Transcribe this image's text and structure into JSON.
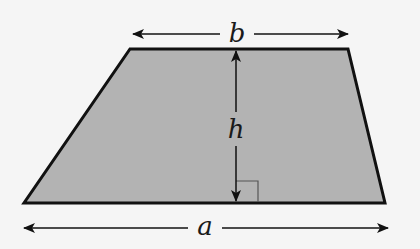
{
  "diagram": {
    "shape": "trapezoid",
    "colors": {
      "background": "#f5f5f5",
      "fill": "#b3b3b3",
      "stroke": "#111111",
      "marker": "#555555"
    },
    "vertices": {
      "top_left": [
        130,
        49
      ],
      "top_right": [
        348,
        49
      ],
      "bottom_right": [
        385,
        203
      ],
      "bottom_left": [
        24,
        203
      ]
    },
    "labels": {
      "top_base": "b",
      "bottom_base": "a",
      "height": "h"
    },
    "annotations": {
      "right_angle_marker": true,
      "top_dimension_arrow": "double-headed",
      "bottom_dimension_arrow": "double-headed",
      "height_arrow": "double-headed"
    }
  }
}
